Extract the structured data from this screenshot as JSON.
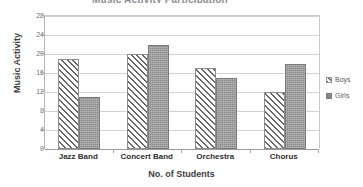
{
  "chart_data": {
    "type": "bar",
    "title": "Music Activity Participation",
    "xlabel": "No. of Students",
    "ylabel": "Music Activity",
    "categories": [
      "Jazz Band",
      "Concert Band",
      "Orchestra",
      "Chorus"
    ],
    "series": [
      {
        "name": "Boys",
        "values": [
          19,
          20,
          17,
          12
        ],
        "color": "#676767",
        "pattern": "diagonal-hatch"
      },
      {
        "name": "Girls",
        "values": [
          11,
          22,
          15,
          18
        ],
        "color": "#8a8a8a",
        "pattern": "solid-gray"
      }
    ],
    "ylim": [
      0,
      28
    ],
    "yticks": [
      0,
      4,
      8,
      12,
      16,
      20,
      24,
      28
    ],
    "ytick_labels": [
      "0",
      "4",
      "8",
      "12",
      "16",
      "20",
      "24",
      "28"
    ],
    "grid": true,
    "legend_position": "right"
  },
  "legend": {
    "entries": [
      {
        "label": "Boys"
      },
      {
        "label": "Girls"
      }
    ]
  }
}
